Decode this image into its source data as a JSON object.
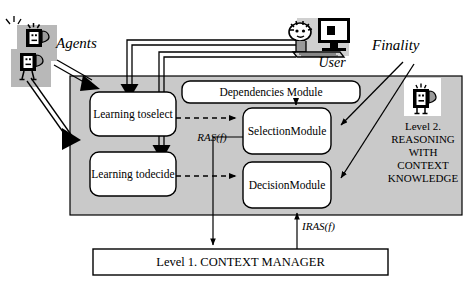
{
  "diagram": {
    "gray_panel_color": "#c9c9c9",
    "stroke_color": "#000000"
  },
  "actors": {
    "agents": {
      "label": "Agents",
      "icon": "robot-agents-icon"
    },
    "user": {
      "label": "User",
      "icon": "user-at-computer-icon"
    },
    "finality": {
      "label": "Finality"
    }
  },
  "level2": {
    "heading_lines": [
      "Level 2.",
      "REASONING",
      "WITH",
      "CONTEXT",
      "KNOWLEDGE"
    ],
    "icon": "robot-icon",
    "modules": [
      {
        "key": "learning_to_select",
        "label": "Learning to\nselect",
        "shape": "rounded-rect"
      },
      {
        "key": "learning_to_decide",
        "label": "Learning to\ndecide",
        "shape": "rounded-rect"
      },
      {
        "key": "dependencies_module",
        "label": "Dependencies Module",
        "shape": "rounded-rect"
      },
      {
        "key": "selection_module",
        "label": "Selection\nModule",
        "shape": "rounded-rect"
      },
      {
        "key": "decision_module",
        "label": "Decision\nModule",
        "shape": "rounded-rect"
      }
    ]
  },
  "level1": {
    "label": "Level 1. CONTEXT MANAGER",
    "shape": "rect"
  },
  "edge_labels": {
    "ras": "RAS(f)",
    "iras": "IRAS(f)"
  }
}
